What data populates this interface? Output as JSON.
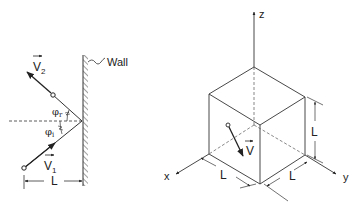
{
  "left_figure": {
    "name": "wall-reflection",
    "wall_label": "Wall",
    "incoming_velocity": {
      "symbol": "V",
      "subscript": "1"
    },
    "outgoing_velocity": {
      "symbol": "V",
      "subscript": "2"
    },
    "incidence_angle": {
      "symbol": "φ",
      "subscript": "i"
    },
    "reflection_angle": {
      "symbol": "φ",
      "subscript": "r"
    },
    "distance_label": "L"
  },
  "right_figure": {
    "name": "cube-box",
    "axes": {
      "x": "x",
      "y": "y",
      "z": "z"
    },
    "velocity": {
      "symbol": "V"
    },
    "edge_length_labels": {
      "height": "L",
      "x_edge": "L",
      "y_edge": "L"
    }
  },
  "colors": {
    "line": "#333333",
    "text": "#222222",
    "background": "#ffffff"
  }
}
